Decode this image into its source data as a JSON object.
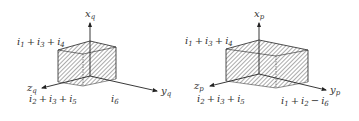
{
  "diagrams": [
    {
      "id": "q",
      "axes": {
        "x": {
          "label": "x",
          "sub": "q"
        },
        "y": {
          "label": "y",
          "sub": "q"
        },
        "z": {
          "label": "z",
          "sub": "q"
        }
      },
      "extents": {
        "x": {
          "terms": [
            {
              "t": "i",
              "s": "1"
            },
            {
              "op": " + "
            },
            {
              "t": "i",
              "s": "3"
            },
            {
              "op": " + "
            },
            {
              "t": "i",
              "s": "4"
            }
          ],
          "text": "i1 + i3 + i4"
        },
        "z": {
          "terms": [
            {
              "t": "i",
              "s": "2"
            },
            {
              "op": " + "
            },
            {
              "t": "i",
              "s": "3"
            },
            {
              "op": " + "
            },
            {
              "t": "i",
              "s": "5"
            }
          ],
          "text": "i2 + i3 + i5"
        },
        "y": {
          "terms": [
            {
              "t": "i",
              "s": "6"
            }
          ],
          "text": "i6"
        }
      }
    },
    {
      "id": "p",
      "axes": {
        "x": {
          "label": "x",
          "sub": "p"
        },
        "y": {
          "label": "y",
          "sub": "p"
        },
        "z": {
          "label": "z",
          "sub": "p"
        }
      },
      "extents": {
        "x": {
          "text": "i1 + i3 + i4"
        },
        "z": {
          "text": "i2 + i3 + i5"
        },
        "y": {
          "text": "i1 + i2 − i6"
        }
      }
    }
  ],
  "labels": {
    "q_x_main": "x",
    "q_x_sub": "q",
    "q_y_main": "y",
    "q_y_sub": "q",
    "q_z_main": "z",
    "q_z_sub": "q",
    "q_top_i1": "1",
    "q_top_i3": "3",
    "q_top_i4": "4",
    "q_bot_i2": "2",
    "q_bot_i3": "3",
    "q_bot_i5": "5",
    "q_y_i6": "6",
    "p_x_main": "x",
    "p_x_sub": "p",
    "p_y_main": "y",
    "p_y_sub": "p",
    "p_z_main": "z",
    "p_z_sub": "p",
    "p_top_i1": "1",
    "p_top_i3": "3",
    "p_top_i4": "4",
    "p_bot_i2": "2",
    "p_bot_i3": "3",
    "p_bot_i5": "5",
    "p_y_i1": "1",
    "p_y_i2": "2",
    "p_y_i6": "6",
    "i": "i",
    "plus": "+",
    "minus": "−"
  },
  "colors": {
    "line": "#222222",
    "hatch": "#333333",
    "text": "#333333"
  }
}
